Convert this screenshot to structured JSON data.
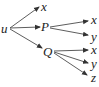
{
  "diagram": {
    "type": "tree",
    "root": "u",
    "nodes": {
      "u": "u",
      "x1": "x",
      "P": "P",
      "Q": "Q",
      "Px": "x",
      "Py": "y",
      "Qx": "x",
      "Qy": "y",
      "Qz": "z"
    },
    "edges": [
      [
        "u",
        "x"
      ],
      [
        "u",
        "P"
      ],
      [
        "u",
        "Q"
      ],
      [
        "P",
        "x"
      ],
      [
        "P",
        "y"
      ],
      [
        "Q",
        "x"
      ],
      [
        "Q",
        "y"
      ],
      [
        "Q",
        "z"
      ]
    ],
    "line_color": "#333333"
  }
}
